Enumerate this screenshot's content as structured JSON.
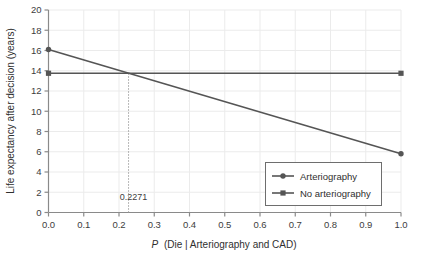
{
  "chart_data": {
    "type": "line",
    "title": "",
    "xlabel": "P (Die | Arteriography and CAD)",
    "xlabel_italic_part": "P",
    "xlabel_rest": "(Die | Arteriography and CAD)",
    "ylabel": "Life expectancy after decision (years)",
    "xlim": [
      0.0,
      1.0
    ],
    "ylim": [
      0,
      20
    ],
    "grid": true,
    "legend_position": "lower right",
    "xticks": [
      "0.0",
      "0.1",
      "0.2",
      "0.3",
      "0.4",
      "0.5",
      "0.6",
      "0.7",
      "0.8",
      "0.9",
      "1.0"
    ],
    "xtick_values": [
      0.0,
      0.1,
      0.2,
      0.3,
      0.4,
      0.5,
      0.6,
      0.7,
      0.8,
      0.9,
      1.0
    ],
    "yticks": [
      "0",
      "2",
      "4",
      "6",
      "8",
      "10",
      "12",
      "14",
      "16",
      "18",
      "20"
    ],
    "ytick_values": [
      0,
      2,
      4,
      6,
      8,
      10,
      12,
      14,
      16,
      18,
      20
    ],
    "series": [
      {
        "name": "Arteriography",
        "marker": "circle",
        "color": "#555555",
        "x": [
          0.0,
          1.0
        ],
        "values": [
          16.1,
          5.8
        ]
      },
      {
        "name": "No arteriography",
        "marker": "square",
        "color": "#555555",
        "x": [
          0.0,
          1.0
        ],
        "values": [
          13.75,
          13.75
        ]
      }
    ],
    "annotations": [
      {
        "text": "0.2271",
        "x": 0.2271,
        "y": 13.75,
        "type": "threshold-dotted-line",
        "label_y": 1.2
      }
    ]
  },
  "legend": {
    "items": [
      {
        "label": "Arteriography",
        "marker": "circle"
      },
      {
        "label": "No arteriography",
        "marker": "square"
      }
    ]
  },
  "colors": {
    "line": "#555555",
    "axis": "#8a8a8a",
    "grid": "#ebebeb",
    "text": "#3d3d3d",
    "legend_border": "#6e6e6e",
    "background": "#ffffff"
  }
}
